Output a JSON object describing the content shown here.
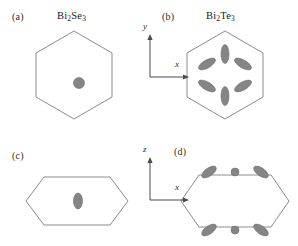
{
  "figure": {
    "width": 298,
    "height": 246,
    "background": "#ffffff",
    "outline_color": "#8c8c8c",
    "pocket_fill": "#858585",
    "pocket_stroke": "#6f6f6f",
    "axis_color": "#4a4a4a"
  },
  "panels": {
    "a": {
      "label": "(a)",
      "material": "Bi2Se3",
      "material_prefix": "Bi",
      "material_sub1": "2",
      "material_mid": "Se",
      "material_sub2": "3",
      "view": "top",
      "zone_shape": "regular-hexagon",
      "pockets": [
        {
          "type": "circle",
          "cx": 0,
          "cy": 0,
          "r": 5.5,
          "angle": 0
        }
      ]
    },
    "b": {
      "label": "(b)",
      "material": "Bi2Te3",
      "material_prefix": "Bi",
      "material_sub1": "2",
      "material_mid": "Te",
      "material_sub2": "3",
      "view": "top",
      "zone_shape": "regular-hexagon",
      "pockets": [
        {
          "type": "ellipse",
          "cx": 0,
          "cy": -20,
          "rx": 4.0,
          "ry": 9.5,
          "angle": 0
        },
        {
          "type": "ellipse",
          "cx": 18,
          "cy": -10,
          "rx": 4.0,
          "ry": 9.5,
          "angle": -60
        },
        {
          "type": "ellipse",
          "cx": 18,
          "cy": 10,
          "rx": 4.0,
          "ry": 9.5,
          "angle": 60
        },
        {
          "type": "ellipse",
          "cx": 0,
          "cy": 20,
          "rx": 4.0,
          "ry": 9.5,
          "angle": 0
        },
        {
          "type": "ellipse",
          "cx": -18,
          "cy": 10,
          "rx": 4.0,
          "ry": 9.5,
          "angle": -60
        },
        {
          "type": "ellipse",
          "cx": -18,
          "cy": -10,
          "rx": 4.0,
          "ry": 9.5,
          "angle": 60
        }
      ]
    },
    "c": {
      "label": "(c)",
      "material": "",
      "view": "side",
      "zone_shape": "elongated-hexagon",
      "pockets": [
        {
          "type": "ellipse",
          "cx": 0,
          "cy": 0,
          "rx": 4.5,
          "ry": 8.0,
          "angle": 0
        }
      ]
    },
    "d": {
      "label": "(d)",
      "material": "",
      "view": "side",
      "zone_shape": "elongated-hexagon",
      "pockets": [
        {
          "type": "ellipse",
          "cx": -26,
          "cy": -25,
          "rx": 4.0,
          "ry": 8.5,
          "angle": 55
        },
        {
          "type": "circle",
          "cx": 0,
          "cy": -25,
          "r": 4.0,
          "angle": 0
        },
        {
          "type": "ellipse",
          "cx": 26,
          "cy": -25,
          "rx": 4.0,
          "ry": 8.5,
          "angle": -55
        },
        {
          "type": "ellipse",
          "cx": -26,
          "cy": 25,
          "rx": 4.0,
          "ry": 8.5,
          "angle": 55
        },
        {
          "type": "circle",
          "cx": 0,
          "cy": 25,
          "r": 4.0,
          "angle": 0
        },
        {
          "type": "ellipse",
          "cx": 26,
          "cy": 25,
          "rx": 4.0,
          "ry": 8.5,
          "angle": -55
        }
      ]
    }
  },
  "axes": {
    "top": {
      "vertical_label": "y",
      "horizontal_label": "x"
    },
    "bottom": {
      "vertical_label": "z",
      "horizontal_label": "x"
    }
  }
}
